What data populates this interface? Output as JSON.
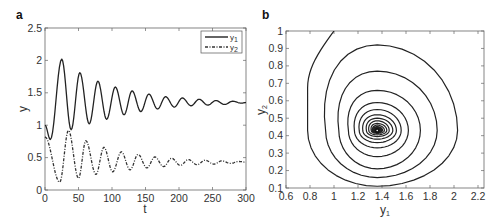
{
  "chart_data": [
    {
      "panel": "a",
      "type": "line",
      "title": "",
      "xlabel": "t",
      "ylabel": "y",
      "xlim": [
        0,
        300
      ],
      "ylim": [
        0,
        2.5
      ],
      "xticks": [
        0,
        50,
        100,
        150,
        200,
        250,
        300
      ],
      "yticks": [
        0,
        0.5,
        1,
        1.5,
        2,
        2.5
      ],
      "xtick_labels": [
        "0",
        "50",
        "100",
        "150",
        "200",
        "250",
        "300"
      ],
      "ytick_labels": [
        "0",
        "0.5",
        "1",
        "1.5",
        "2",
        "2.5"
      ],
      "grid": false,
      "legend_position": "upper right",
      "series": [
        {
          "name": "y1",
          "label_main": "y",
          "label_sub": "1",
          "style": "solid",
          "color": "#222222",
          "extrema": [
            [
              0,
              1.0
            ],
            [
              8,
              0.78
            ],
            [
              25,
              2.02
            ],
            [
              39,
              0.93
            ],
            [
              52,
              1.81
            ],
            [
              66,
              1.02
            ],
            [
              79,
              1.68
            ],
            [
              92,
              1.09
            ],
            [
              105,
              1.59
            ],
            [
              118,
              1.16
            ],
            [
              130,
              1.53
            ],
            [
              143,
              1.21
            ],
            [
              155,
              1.48
            ],
            [
              168,
              1.25
            ],
            [
              180,
              1.44
            ],
            [
              193,
              1.28
            ],
            [
              205,
              1.42
            ],
            [
              218,
              1.3
            ],
            [
              230,
              1.4
            ],
            [
              243,
              1.31
            ],
            [
              255,
              1.38
            ],
            [
              268,
              1.32
            ],
            [
              280,
              1.37
            ],
            [
              293,
              1.34
            ],
            [
              300,
              1.35
            ]
          ]
        },
        {
          "name": "y2",
          "label_main": "y",
          "label_sub": "2",
          "style": "dashdot",
          "color": "#333333",
          "extrema": [
            [
              0,
              0.82
            ],
            [
              22,
              0.12
            ],
            [
              35,
              0.92
            ],
            [
              50,
              0.18
            ],
            [
              61,
              0.76
            ],
            [
              76,
              0.24
            ],
            [
              88,
              0.66
            ],
            [
              101,
              0.28
            ],
            [
              114,
              0.59
            ],
            [
              127,
              0.31
            ],
            [
              139,
              0.55
            ],
            [
              152,
              0.34
            ],
            [
              164,
              0.51
            ],
            [
              177,
              0.36
            ],
            [
              189,
              0.49
            ],
            [
              202,
              0.38
            ],
            [
              214,
              0.47
            ],
            [
              227,
              0.39
            ],
            [
              239,
              0.46
            ],
            [
              252,
              0.4
            ],
            [
              264,
              0.45
            ],
            [
              277,
              0.41
            ],
            [
              289,
              0.44
            ],
            [
              300,
              0.43
            ]
          ]
        }
      ]
    },
    {
      "panel": "b",
      "type": "line",
      "title": "",
      "xlabel": "y1",
      "xlabel_main": "y",
      "xlabel_sub": "1",
      "ylabel": "y2",
      "ylabel_main": "y",
      "ylabel_sub": "2",
      "xlim": [
        0.6,
        2.25
      ],
      "ylim": [
        0.1,
        1.0
      ],
      "xticks": [
        0.6,
        0.8,
        1,
        1.2,
        1.4,
        1.6,
        1.8,
        2,
        2.2
      ],
      "yticks": [
        0.1,
        0.2,
        0.3,
        0.4,
        0.5,
        0.6,
        0.7,
        0.8,
        0.9,
        1
      ],
      "xtick_labels": [
        "0.6",
        "0.8",
        "1",
        "1.2",
        "1.4",
        "1.6",
        "1.8",
        "2",
        "2.2"
      ],
      "ytick_labels": [
        "0.1",
        "0.2",
        "0.3",
        "0.4",
        "0.5",
        "0.6",
        "0.7",
        "0.8",
        "0.9",
        "1"
      ],
      "grid": false,
      "equilibrium": [
        1.36,
        0.43
      ],
      "start_point": [
        1.0,
        1.0
      ],
      "loops": {
        "left": [
          0.78,
          0.93,
          1.04,
          1.12,
          1.17,
          1.21,
          1.24,
          1.27,
          1.29,
          1.31,
          1.32,
          1.33,
          1.34,
          1.35
        ],
        "bottom": [
          0.11,
          0.16,
          0.21,
          0.28,
          0.33,
          0.36,
          0.38,
          0.395,
          0.405,
          0.413,
          0.419,
          0.423,
          0.426,
          0.428
        ],
        "right": [
          2.03,
          1.86,
          1.72,
          1.62,
          1.56,
          1.52,
          1.49,
          1.46,
          1.44,
          1.42,
          1.405,
          1.395,
          1.385,
          1.378
        ],
        "top": [
          0.92,
          0.77,
          0.66,
          0.59,
          0.55,
          0.52,
          0.5,
          0.485,
          0.47,
          0.46,
          0.452,
          0.446,
          0.441,
          0.437
        ]
      }
    }
  ]
}
